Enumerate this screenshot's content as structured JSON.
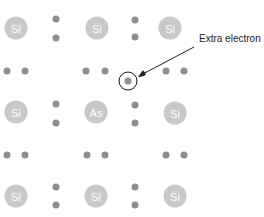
{
  "diagram": {
    "colors": {
      "atom_fill": "#c9c9c9",
      "atom_text": "#ffffff",
      "electron": "#8e8e8e",
      "ring": "#111111",
      "label": "#222222"
    },
    "atoms": [
      {
        "symbol": "Si",
        "x": 16,
        "y": 28
      },
      {
        "symbol": "Si",
        "x": 97,
        "y": 28
      },
      {
        "symbol": "Si",
        "x": 170,
        "y": 28
      },
      {
        "symbol": "Si",
        "x": 16,
        "y": 112
      },
      {
        "symbol": "As",
        "x": 96,
        "y": 112
      },
      {
        "symbol": "Si",
        "x": 175,
        "y": 113
      },
      {
        "symbol": "Si",
        "x": 16,
        "y": 196
      },
      {
        "symbol": "Si",
        "x": 96,
        "y": 196
      },
      {
        "symbol": "Si",
        "x": 175,
        "y": 196
      }
    ],
    "extra_electron": {
      "x": 128,
      "y": 81
    },
    "annotation": {
      "label": "Extra electron",
      "x": 199,
      "y": 33
    }
  }
}
